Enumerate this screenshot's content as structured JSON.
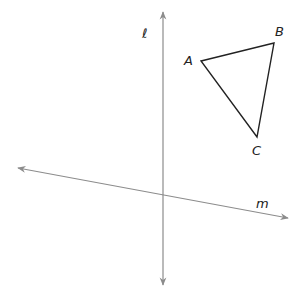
{
  "diagram": {
    "lines": [
      {
        "name": "l",
        "label": "ℓ",
        "x1": 163,
        "y1": 12,
        "x2": 163,
        "y2": 285,
        "color": "#8c8c8c",
        "label_x": 142,
        "label_y": 38
      },
      {
        "name": "m",
        "label": "m",
        "x1": 18,
        "y1": 168,
        "x2": 288,
        "y2": 218,
        "color": "#8c8c8c",
        "label_x": 256,
        "label_y": 208
      }
    ],
    "triangle": {
      "stroke": "#222222",
      "vertices": [
        {
          "label": "A",
          "x": 201,
          "y": 61,
          "label_x": 184,
          "label_y": 65
        },
        {
          "label": "B",
          "x": 274,
          "y": 43,
          "label_x": 275,
          "label_y": 36
        },
        {
          "label": "C",
          "x": 257,
          "y": 137,
          "label_x": 252,
          "label_y": 155
        }
      ]
    }
  }
}
